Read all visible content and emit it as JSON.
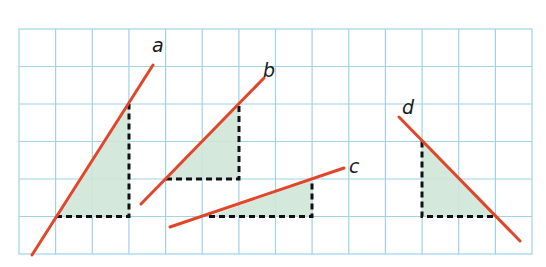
{
  "figure": {
    "colors": {
      "grid": "#9fd3ea",
      "line": "#e2462a",
      "triangle_fill": "#cfe6d8",
      "dashed_legs": "#111111"
    },
    "grid": {
      "columns": 14,
      "rows": 6
    },
    "lines": [
      {
        "label": "a",
        "rise": 3,
        "run": 2,
        "direction": "up-right"
      },
      {
        "label": "b",
        "rise": 2,
        "run": 2,
        "direction": "up-right"
      },
      {
        "label": "c",
        "rise": 1,
        "run": 3,
        "direction": "up-right"
      },
      {
        "label": "d",
        "rise": 2,
        "run": 2,
        "direction": "down-right"
      }
    ]
  }
}
